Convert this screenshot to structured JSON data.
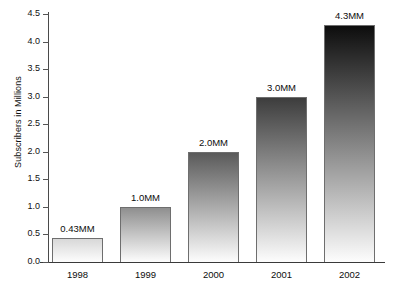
{
  "chart_data": {
    "type": "bar",
    "title": "",
    "xlabel": "",
    "ylabel": "Subscribers in Millions",
    "categories": [
      "1998",
      "1999",
      "2000",
      "2001",
      "2002"
    ],
    "values": [
      0.43,
      1.0,
      2.0,
      3.0,
      4.3
    ],
    "data_labels": [
      "0.43MM",
      "1.0MM",
      "2.0MM",
      "3.0MM",
      "4.3MM"
    ],
    "ylim": [
      0.0,
      4.5
    ],
    "ytick_labels": [
      "0.0",
      "0.5",
      "1.0",
      "1.5",
      "2.0",
      "2.5",
      "3.0",
      "3.5",
      "4.0",
      "4.5"
    ],
    "ytick_values": [
      0.0,
      0.5,
      1.0,
      1.5,
      2.0,
      2.5,
      3.0,
      3.5,
      4.0,
      4.5
    ],
    "grid": false,
    "legend": null,
    "bar_style": {
      "fill": "vertical-gradient-dark-top-to-light-bottom",
      "border_color": "#6e6e6e",
      "gradient_top_colors": [
        "#d8d8d8",
        "#8f8f8f",
        "#5a5a5a",
        "#3d3d3d",
        "#0d0d0d"
      ],
      "gradient_bottom_color": "#fdfdfd"
    }
  }
}
